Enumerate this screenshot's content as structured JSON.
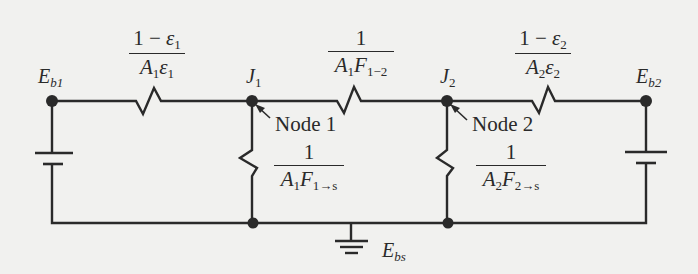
{
  "diagram": {
    "type": "radiation-network circuit",
    "nodes": {
      "eb1": {
        "main": "E",
        "sub": "b1"
      },
      "j1": {
        "main": "J",
        "sub": "1"
      },
      "j2": {
        "main": "J",
        "sub": "2"
      },
      "eb2": {
        "main": "E",
        "sub": "b2"
      },
      "ebs": {
        "main": "E",
        "sub": "bs"
      }
    },
    "node_callouts": {
      "node1": "Node 1",
      "node2": "Node 2"
    },
    "resistances": {
      "surface1": {
        "num_a": "1 − ",
        "num_eps": "ε",
        "num_sub": "1",
        "den_a": "A",
        "den_a_sub": "1",
        "den_eps": "ε",
        "den_eps_sub": "1"
      },
      "space12": {
        "num": "1",
        "den_a": "A",
        "den_a_sub": "1",
        "den_f": "F",
        "den_f_sub": "1−2"
      },
      "surface2": {
        "num_a": "1 − ",
        "num_eps": "ε",
        "num_sub": "2",
        "den_a": "A",
        "den_a_sub": "2",
        "den_eps": "ε",
        "den_eps_sub": "2"
      },
      "space1s": {
        "num": "1",
        "den_a": "A",
        "den_a_sub": "1",
        "den_f": "F",
        "den_f_sub": "1→s"
      },
      "space2s": {
        "num": "1",
        "den_a": "A",
        "den_a_sub": "2",
        "den_f": "F",
        "den_f_sub": "2→s"
      }
    },
    "colors": {
      "background": "#f1f1ef",
      "ink": "#2a2a2a"
    }
  }
}
